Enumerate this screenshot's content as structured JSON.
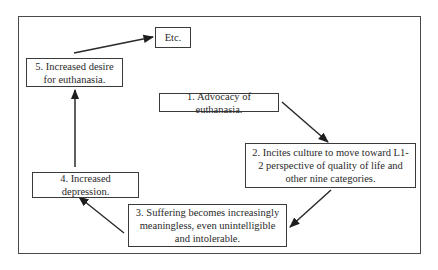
{
  "diagram": {
    "type": "cycle-flowchart",
    "nodes": [
      {
        "id": "b1",
        "label": "1. Advocacy of euthanasia."
      },
      {
        "id": "b2",
        "label": "2. Incites culture to move toward L1-2 perspective of quality of life and other nine categories."
      },
      {
        "id": "b3",
        "label": "3. Suffering becomes increasingly meaningless, even unintelligible and intolerable."
      },
      {
        "id": "b4",
        "label": "4. Increased depression."
      },
      {
        "id": "b5",
        "label": "5. Increased desire for euthanasia."
      },
      {
        "id": "etc",
        "label": "Etc."
      }
    ],
    "edges": [
      {
        "from": "b1",
        "to": "b2"
      },
      {
        "from": "b2",
        "to": "b3"
      },
      {
        "from": "b3",
        "to": "b4"
      },
      {
        "from": "b4",
        "to": "b5"
      },
      {
        "from": "b5",
        "to": "etc"
      }
    ],
    "colors": {
      "line": "#2a2a2a",
      "frame": "#4a4a4a",
      "background": "#ffffff"
    }
  }
}
